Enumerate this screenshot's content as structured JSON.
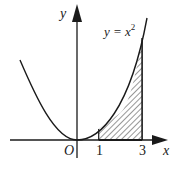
{
  "diagram": {
    "curve_label": "y = x",
    "curve_exponent": "2",
    "x_axis_label": "x",
    "y_axis_label": "y",
    "origin_label": "O",
    "tick_labels": [
      "1",
      "3"
    ],
    "shaded_region": {
      "from": 1,
      "to": 3,
      "under": "y = x^2",
      "pattern": "diagonal-hatch"
    },
    "colors": {
      "ink": "#1a1a1a",
      "background": "#ffffff"
    }
  }
}
